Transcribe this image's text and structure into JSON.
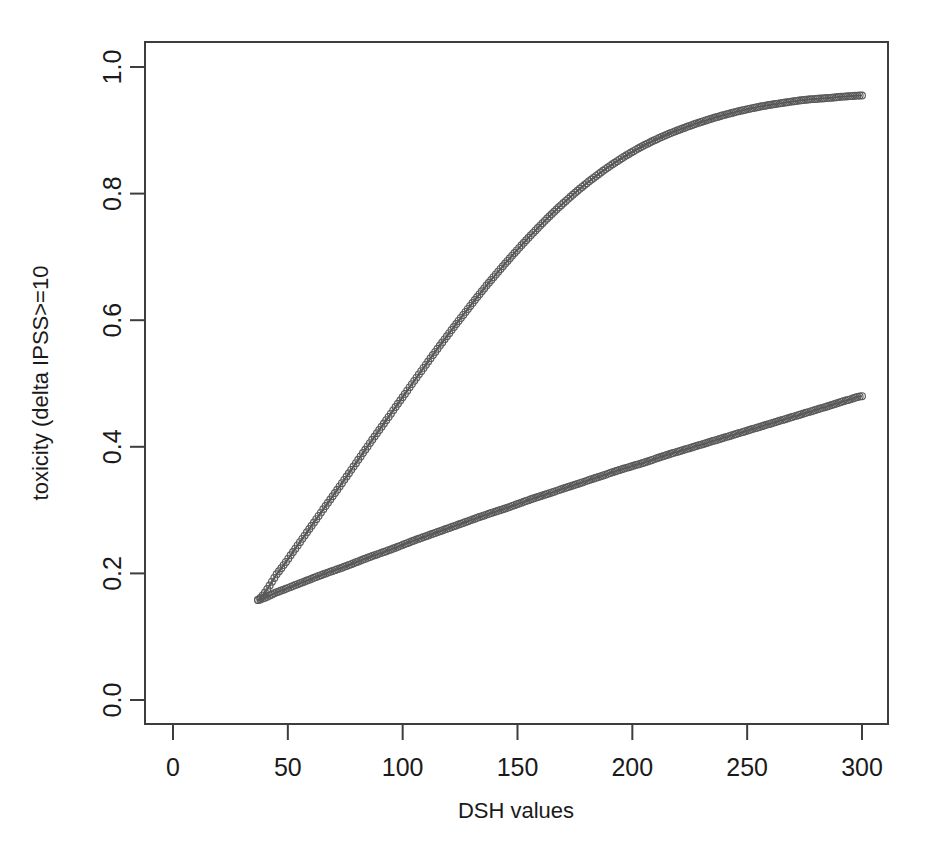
{
  "chart_data": {
    "type": "scatter",
    "title": "",
    "xlabel": "DSH values",
    "ylabel": "toxicity (delta IPSS>=10",
    "xlim": [
      0,
      310
    ],
    "ylim": [
      0.0,
      1.04
    ],
    "xticks": [
      0,
      50,
      100,
      150,
      200,
      250,
      300
    ],
    "xtick_labels": [
      "0",
      "50",
      "100",
      "150",
      "200",
      "250",
      "300"
    ],
    "yticks": [
      0.0,
      0.2,
      0.4,
      0.6,
      0.8,
      1.0
    ],
    "ytick_labels": [
      "0.0",
      "0.2",
      "0.4",
      "0.6",
      "0.8",
      "1.0"
    ],
    "grid": false,
    "legend": null,
    "marker": "open-circle",
    "marker_color": "#565656",
    "axis_color": "#3d3d3d",
    "background": "#ffffff",
    "series": [
      {
        "name": "upper-curve",
        "marker_color": "#565656",
        "x": [
          37,
          45,
          55,
          65,
          75,
          85,
          95,
          105,
          115,
          125,
          135,
          145,
          155,
          165,
          175,
          185,
          195,
          205,
          215,
          225,
          235,
          245,
          255,
          265,
          275,
          285,
          295,
          300
        ],
        "y": [
          0.158,
          0.198,
          0.248,
          0.299,
          0.35,
          0.402,
          0.453,
          0.504,
          0.554,
          0.602,
          0.648,
          0.691,
          0.731,
          0.768,
          0.801,
          0.83,
          0.855,
          0.876,
          0.893,
          0.907,
          0.919,
          0.929,
          0.937,
          0.943,
          0.948,
          0.951,
          0.954,
          0.955
        ]
      },
      {
        "name": "lower-curve",
        "marker_color": "#565656",
        "x": [
          37,
          45,
          55,
          65,
          75,
          85,
          95,
          105,
          115,
          125,
          135,
          145,
          155,
          165,
          175,
          185,
          195,
          205,
          215,
          225,
          235,
          245,
          255,
          265,
          275,
          285,
          295,
          300
        ],
        "y": [
          0.158,
          0.17,
          0.184,
          0.198,
          0.211,
          0.225,
          0.238,
          0.252,
          0.265,
          0.278,
          0.291,
          0.303,
          0.316,
          0.328,
          0.34,
          0.352,
          0.364,
          0.375,
          0.387,
          0.398,
          0.409,
          0.42,
          0.431,
          0.442,
          0.453,
          0.464,
          0.475,
          0.48
        ]
      }
    ]
  }
}
